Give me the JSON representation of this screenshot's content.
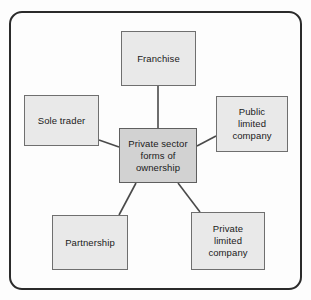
{
  "diagram": {
    "title": "Private sector forms of ownership",
    "type": "spider-diagram",
    "center": {
      "id": "center",
      "label": "Private sector forms of ownership",
      "line1": "Private sector",
      "line2": "forms of",
      "line3": "ownership",
      "fill": "#d2d2d2",
      "border": "#5f5f5f"
    },
    "nodes": [
      {
        "id": "franchise",
        "label": "Franchise",
        "lines": [
          "Franchise"
        ],
        "fill": "#e9e9e9",
        "border": "#6f6f6f"
      },
      {
        "id": "sole-trader",
        "label": "Sole trader",
        "lines": [
          "Sole trader"
        ],
        "fill": "#e9e9e9",
        "border": "#6f6f6f"
      },
      {
        "id": "public-limited-company",
        "label": "Public limited company",
        "lines": [
          "Public",
          "limited",
          "company"
        ],
        "fill": "#e9e9e9",
        "border": "#6f6f6f"
      },
      {
        "id": "partnership",
        "label": "Partnership",
        "lines": [
          "Partnership"
        ],
        "fill": "#e9e9e9",
        "border": "#6f6f6f"
      },
      {
        "id": "private-limited-company",
        "label": "Private limited company",
        "lines": [
          "Private",
          "limited",
          "company"
        ],
        "fill": "#e9e9e9",
        "border": "#6f6f6f"
      }
    ],
    "connectors": [
      {
        "from": "center",
        "to": "franchise"
      },
      {
        "from": "center",
        "to": "sole-trader"
      },
      {
        "from": "center",
        "to": "public-limited-company"
      },
      {
        "from": "center",
        "to": "partnership"
      },
      {
        "from": "center",
        "to": "private-limited-company"
      }
    ],
    "frame": {
      "border_color": "#2b2b2b",
      "background": "#fdfdfd"
    }
  }
}
